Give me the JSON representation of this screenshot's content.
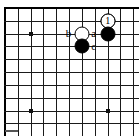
{
  "figure": {
    "kind": "go-board-diagram",
    "title": "",
    "caption": ""
  },
  "board": {
    "line_color": "#1a1a1a",
    "edge_color": "#000000",
    "background": "#ffffff",
    "origin_x": 5,
    "origin_y": 8,
    "spacing": 12.83,
    "cols": 11,
    "rows": 10,
    "edges": {
      "left": true,
      "top": true,
      "right": false,
      "bottom": false
    },
    "hoshi": [
      {
        "col": 2,
        "row": 2
      },
      {
        "col": 2,
        "row": 8
      },
      {
        "col": 8,
        "row": 8
      }
    ]
  },
  "stones": [
    {
      "id": "white-move-1",
      "color": "white",
      "col": 8,
      "row": 1,
      "marker": "1"
    },
    {
      "id": "black-corner",
      "color": "black",
      "col": 8,
      "row": 2,
      "marker": ""
    },
    {
      "id": "white-center",
      "color": "white",
      "col": 6,
      "row": 2,
      "marker": ""
    },
    {
      "id": "black-below",
      "color": "black",
      "col": 6,
      "row": 3,
      "marker": ""
    }
  ],
  "point_labels": [
    {
      "id": "label-a",
      "text": "a",
      "col": 7,
      "row": 2
    },
    {
      "id": "label-b",
      "text": "b",
      "col": 5,
      "row": 2
    },
    {
      "id": "label-c",
      "text": "c",
      "col": 7,
      "row": 3
    }
  ],
  "colors": {
    "black_stone": "#000000",
    "white_stone": "#ffffff",
    "grid": "#1a1a1a",
    "label_text": "#000000"
  }
}
